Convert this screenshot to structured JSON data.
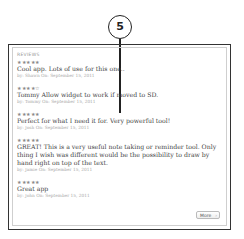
{
  "callout": {
    "number": "5"
  },
  "reviews_section": {
    "title": "REVIEWS",
    "items": [
      {
        "stars": "★★★★★",
        "title": "Cool app. Lots of use for this one..",
        "meta": "by: Shawn  On: September 15, 2011"
      },
      {
        "stars": "★★★★☆",
        "title": "Tommy   Allow widget to work if moved to SD.",
        "meta": "by: Tommy  On: September 15, 2011"
      },
      {
        "stars": "★★★★★",
        "title": "Perfect for what I need it for. Very powerful tool!",
        "meta": "by: Josh  On: September 15, 2011"
      },
      {
        "stars": "★★★★★",
        "title": "GREAT!  This is a very useful note taking or reminder tool. Only thing I wish was different would be the possibility to draw by hand right on top of the text.",
        "meta": "by: Jamie  On: September 15, 2011"
      },
      {
        "stars": "★★★★★",
        "title": "Great app",
        "meta": "by: John  On: September 15, 2011"
      }
    ],
    "more_button": {
      "label": "More",
      "icon": "chevron-right-icon"
    }
  }
}
